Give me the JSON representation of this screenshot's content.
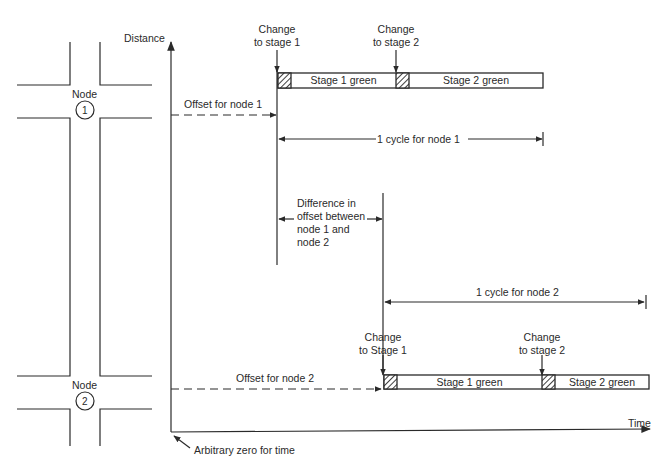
{
  "axes": {
    "y_label": "Distance",
    "x_label": "Time",
    "origin_label": "Arbitrary zero for time"
  },
  "nodes": [
    {
      "label": "Node",
      "number": "1"
    },
    {
      "label": "Node",
      "number": "2"
    }
  ],
  "node1_timeline": {
    "change_stage1": [
      "Change",
      "to stage 1"
    ],
    "change_stage2": [
      "Change",
      "to stage 2"
    ],
    "stage1": "Stage 1 green",
    "stage2": "Stage 2 green",
    "offset": "Offset for node 1",
    "cycle": "1 cycle for node 1"
  },
  "difference": [
    "Difference in",
    "offset between",
    "node 1 and",
    "node 2"
  ],
  "node2_timeline": {
    "change_stage1": [
      "Change",
      "to Stage 1"
    ],
    "change_stage2": [
      "Change",
      "to stage 2"
    ],
    "stage1": "Stage 1 green",
    "stage2": "Stage 2 green",
    "offset": "Offset for node 2",
    "cycle": "1 cycle for node 2"
  },
  "colors": {
    "line": "#2a2a2a",
    "background": "#ffffff"
  }
}
